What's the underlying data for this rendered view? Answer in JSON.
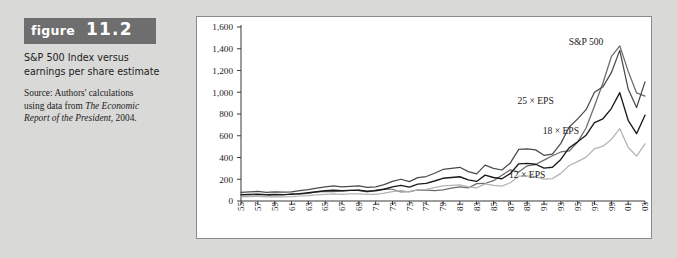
{
  "figure": {
    "label_word": "figure",
    "label_number": "11.2",
    "title_line1": "S&P 500 Index versus",
    "title_line2": "earnings per share estimate",
    "source_line1": "Source: Authors' calculations",
    "source_line2_plain": "using data from ",
    "source_line2_italic": "The Economic",
    "source_line3_italic": "Report of the President,",
    "source_line3_plain": " 2004."
  },
  "colors": {
    "background": "#d9d9d7",
    "panel": "#ffffff",
    "panel_border": "#8a8a8a",
    "badge": "#6e6e6e",
    "sp500": "#6b6b6b",
    "eps25": "#4a4a4a",
    "eps18": "#1a1a1a",
    "eps12": "#b3b3b3",
    "axis": "#3a3a3a"
  },
  "chart_data": {
    "type": "line",
    "title": "S&P 500 Index versus earnings per share estimate",
    "xlabel": "",
    "ylabel": "",
    "ylim": [
      0,
      1600
    ],
    "yticks": [
      0,
      200,
      400,
      600,
      800,
      1000,
      1200,
      1400,
      1600
    ],
    "ytick_labels": [
      "0",
      "200",
      "400",
      "600",
      "800",
      "1,000",
      "1,200",
      "1,400",
      "1,600"
    ],
    "grid": false,
    "legend_position": "inline-annotations",
    "x": [
      1955,
      1956,
      1957,
      1958,
      1959,
      1960,
      1961,
      1962,
      1963,
      1964,
      1965,
      1966,
      1967,
      1968,
      1969,
      1970,
      1971,
      1972,
      1973,
      1974,
      1975,
      1976,
      1977,
      1978,
      1979,
      1980,
      1981,
      1982,
      1983,
      1984,
      1985,
      1986,
      1987,
      1988,
      1989,
      1990,
      1991,
      1992,
      1993,
      1994,
      1995,
      1996,
      1997,
      1998,
      1999,
      2000,
      2001,
      2002,
      2003
    ],
    "xtick_labels": [
      "55",
      "57",
      "59",
      "61",
      "63",
      "65",
      "67",
      "69",
      "71",
      "73",
      "75",
      "77",
      "79",
      "81",
      "83",
      "85",
      "87",
      "89",
      "91",
      "93",
      "95",
      "97",
      "99",
      "01",
      "03"
    ],
    "xtick_years": [
      1955,
      1957,
      1959,
      1961,
      1963,
      1965,
      1967,
      1969,
      1971,
      1973,
      1975,
      1977,
      1979,
      1981,
      1983,
      1985,
      1987,
      1989,
      1991,
      1993,
      1995,
      1997,
      1999,
      2001,
      2003
    ],
    "series": [
      {
        "name": "S&P 500",
        "label": "S&P 500",
        "color": "#6b6b6b",
        "label_x": 1996,
        "label_y": 1430,
        "values": [
          45,
          46,
          45,
          46,
          58,
          57,
          67,
          63,
          70,
          83,
          89,
          86,
          92,
          98,
          98,
          83,
          99,
          110,
          108,
          83,
          86,
          102,
          99,
          96,
          103,
          118,
          129,
          120,
          160,
          161,
          187,
          237,
          287,
          266,
          323,
          335,
          376,
          416,
          451,
          460,
          542,
          671,
          873,
          1085,
          1327,
          1427,
          1194,
          994,
          965
        ]
      },
      {
        "name": "25 × EPS",
        "label": "25 × EPS",
        "color": "#4a4a4a",
        "label_x": 1990,
        "label_y": 890,
        "values": [
          80,
          85,
          88,
          80,
          85,
          82,
          85,
          95,
          105,
          118,
          130,
          138,
          130,
          135,
          138,
          125,
          130,
          150,
          180,
          200,
          178,
          215,
          225,
          255,
          290,
          300,
          310,
          270,
          250,
          330,
          300,
          285,
          350,
          475,
          480,
          470,
          420,
          430,
          530,
          680,
          755,
          840,
          1000,
          1050,
          1180,
          1385,
          1030,
          860,
          1095
        ]
      },
      {
        "name": "18 × EPS",
        "label": "18 × EPS",
        "color": "#1a1a1a",
        "label_x": 1993,
        "label_y": 620,
        "values": [
          58,
          61,
          63,
          58,
          61,
          59,
          61,
          68,
          76,
          85,
          94,
          99,
          94,
          97,
          99,
          90,
          94,
          108,
          130,
          144,
          128,
          155,
          162,
          184,
          209,
          216,
          223,
          194,
          180,
          238,
          216,
          205,
          252,
          342,
          346,
          338,
          302,
          310,
          382,
          490,
          544,
          605,
          720,
          756,
          850,
          997,
          742,
          619,
          789
        ]
      },
      {
        "name": "12 × EPS",
        "label": "12 × EPS",
        "color": "#b3b3b3",
        "label_x": 1989,
        "label_y": 215,
        "values": [
          38,
          41,
          42,
          39,
          41,
          39,
          41,
          46,
          50,
          57,
          62,
          66,
          62,
          65,
          66,
          60,
          62,
          72,
          86,
          96,
          85,
          103,
          108,
          122,
          139,
          144,
          149,
          130,
          120,
          158,
          144,
          137,
          168,
          228,
          230,
          225,
          201,
          206,
          254,
          326,
          362,
          403,
          480,
          504,
          566,
          665,
          494,
          413,
          526
        ]
      }
    ]
  }
}
